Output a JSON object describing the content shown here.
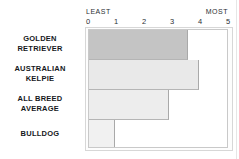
{
  "chart_data": {
    "type": "bar",
    "orientation": "horizontal",
    "title": "",
    "subtitle": "",
    "xlabel": "",
    "ylabel": "",
    "xlim": [
      0,
      5
    ],
    "grid": false,
    "legend": false,
    "axis_end_labels": {
      "low": "LEAST",
      "high": "MOST"
    },
    "tick_labels": [
      "0",
      "1",
      "2",
      "3",
      "4",
      "5"
    ],
    "tick_values": [
      0,
      1,
      2,
      3,
      4,
      5
    ],
    "categories": [
      "GOLDEN RETRIEVER",
      "AUSTRALIAN KELPIE",
      "ALL BREED AVERAGE",
      "BULLDOG"
    ],
    "values": [
      3.6,
      4.0,
      2.9,
      0.95
    ],
    "bars": [
      {
        "label": "GOLDEN RETRIEVER",
        "label_lines": [
          "GOLDEN",
          "RETRIEVER"
        ],
        "value": 3.6,
        "color": "#c4c4c4"
      },
      {
        "label": "AUSTRALIAN KELPIE",
        "label_lines": [
          "AUSTRALIAN",
          "KELPIE"
        ],
        "value": 4.0,
        "color": "#e9e9e9"
      },
      {
        "label": "ALL BREED AVERAGE",
        "label_lines": [
          "ALL BREED",
          "AVERAGE"
        ],
        "value": 2.9,
        "color": "#ededed"
      },
      {
        "label": "BULLDOG",
        "label_lines": [
          "BULLDOG"
        ],
        "value": 0.95,
        "color": "#f1f1f1"
      }
    ]
  },
  "colors": {
    "background": "#ffffff",
    "frame_border": "#d7d7d7",
    "plot_border": "#c9c9c9",
    "bar_edge": "#a9a9a9",
    "text": "#15181c",
    "axis_text": "#2b2f33"
  }
}
